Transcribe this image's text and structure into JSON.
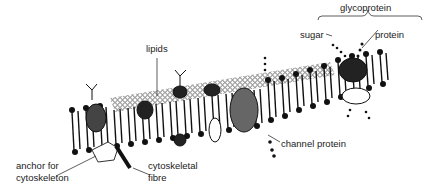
{
  "diagram": {
    "labels": {
      "glycoprotein": "glycoprotein",
      "sugar": "sugar",
      "protein": "protein",
      "lipids": "lipids",
      "channel_protein": "channel protein",
      "anchor_line1": "anchor for",
      "anchor_line2": "cytoskeleton",
      "fibre_line1": "cytoskeletal",
      "fibre_line2": "fibre"
    },
    "colors": {
      "ink": "#111111",
      "text": "#222222",
      "background": "#ffffff"
    }
  }
}
